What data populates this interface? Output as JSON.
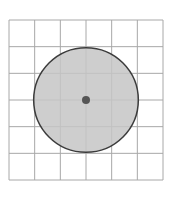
{
  "diagram": {
    "type": "circle-on-grid",
    "grid": {
      "columns": 6,
      "rows": 6,
      "line_color": "#a8a8a8",
      "x0": 9,
      "y0": 20,
      "x1": 163,
      "y1": 180
    },
    "circle": {
      "center_col": 3,
      "center_row": 3,
      "radius_cells": 2,
      "fill": "#c6c6c6",
      "stroke": "#3c3c3c"
    },
    "center_point": {
      "color": "#555555",
      "radius": 4
    }
  }
}
